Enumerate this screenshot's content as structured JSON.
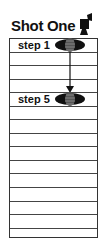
{
  "title": "Shot One",
  "title_icon": "camera-icon",
  "grid": {
    "row_count": 15,
    "row_lines_y": [
      52,
      65,
      79,
      92,
      106,
      119,
      133,
      146,
      160,
      173,
      187,
      201,
      214,
      228
    ]
  },
  "steps": [
    {
      "label": "step 1",
      "row": 1,
      "node_icon": "scene-node-icon"
    },
    {
      "label": "step 5",
      "row": 5,
      "node_icon": "scene-node-icon"
    }
  ],
  "connector": {
    "from": "step 1",
    "to": "step 5",
    "type": "arrow-down"
  },
  "colors": {
    "ink": "#111111",
    "line": "#444444",
    "background": "#ffffff"
  }
}
